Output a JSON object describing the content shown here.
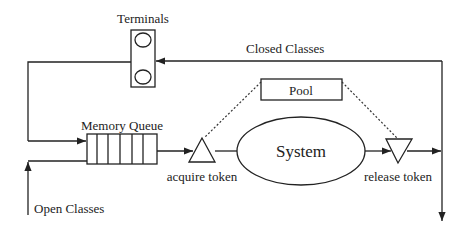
{
  "diagram": {
    "nodes": {
      "terminals": {
        "label": "Terminals"
      },
      "memory_queue": {
        "label": "Memory  Queue"
      },
      "acquire_token": {
        "label": "acquire  token"
      },
      "system": {
        "label": "System"
      },
      "release_token": {
        "label": "release  token"
      },
      "pool": {
        "label": "Pool"
      }
    },
    "flows": {
      "closed_classes": {
        "label": "Closed  Classes"
      },
      "open_classes": {
        "label": "Open  Classes"
      }
    },
    "colors": {
      "stroke": "#222222",
      "background": "#ffffff"
    }
  }
}
